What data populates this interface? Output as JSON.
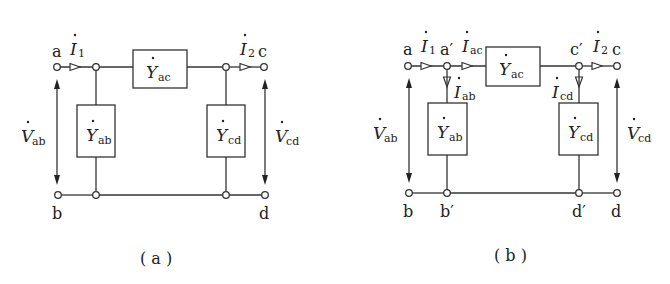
{
  "figure": {
    "panels": [
      {
        "id": "a",
        "caption": "( a )",
        "terminals": {
          "top_left": "a",
          "top_right": "c",
          "bottom_left": "b",
          "bottom_right": "d"
        },
        "admittances": {
          "series": {
            "symbol": "Y",
            "sub": "ac"
          },
          "shunt_left": {
            "symbol": "Y",
            "sub": "ab"
          },
          "shunt_right": {
            "symbol": "Y",
            "sub": "cd"
          }
        },
        "currents": {
          "input": {
            "symbol": "I",
            "sub": "1"
          },
          "output": {
            "symbol": "I",
            "sub": "2"
          }
        },
        "voltages": {
          "left": {
            "symbol": "V",
            "sub": "ab"
          },
          "right": {
            "symbol": "V",
            "sub": "cd"
          }
        }
      },
      {
        "id": "b",
        "caption": "( b )",
        "terminals": {
          "top_left": "a",
          "top_right": "c",
          "bottom_left": "b",
          "bottom_right": "d"
        },
        "inner_nodes": {
          "a_prime": "a′",
          "c_prime": "c′",
          "b_prime": "b′",
          "d_prime": "d′"
        },
        "admittances": {
          "series": {
            "symbol": "Y",
            "sub": "ac"
          },
          "shunt_left": {
            "symbol": "Y",
            "sub": "ab"
          },
          "shunt_right": {
            "symbol": "Y",
            "sub": "cd"
          }
        },
        "currents": {
          "input": {
            "symbol": "I",
            "sub": "1"
          },
          "series": {
            "symbol": "I",
            "sub": "ac"
          },
          "shunt_left": {
            "symbol": "I",
            "sub": "ab"
          },
          "shunt_right": {
            "symbol": "I",
            "sub": "cd"
          },
          "output": {
            "symbol": "I",
            "sub": "2"
          }
        },
        "voltages": {
          "left": {
            "symbol": "V",
            "sub": "ab"
          },
          "right": {
            "symbol": "V",
            "sub": "cd"
          }
        }
      }
    ]
  }
}
